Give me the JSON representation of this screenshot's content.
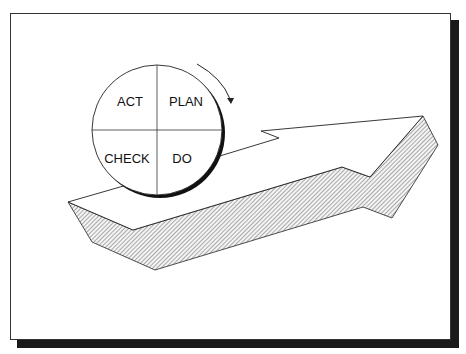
{
  "diagram": {
    "type": "PDCA cycle on rising arrow",
    "quadrants": [
      {
        "position": "top-left",
        "label": "ACT"
      },
      {
        "position": "top-right",
        "label": "PLAN"
      },
      {
        "position": "bottom-left",
        "label": "CHECK"
      },
      {
        "position": "bottom-right",
        "label": "DO"
      }
    ],
    "rotation_indicator": "clockwise",
    "colors": {
      "stroke": "#111111",
      "frame_shadow": "#1a1a1a",
      "hatch": "#555555",
      "background": "#ffffff"
    }
  }
}
